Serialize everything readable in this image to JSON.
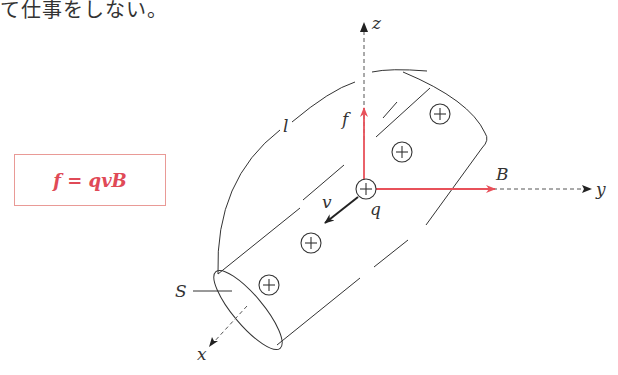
{
  "caption": "て仕事をしない。",
  "formula": "f = qvB",
  "labels": {
    "z": "z",
    "y": "y",
    "x": "x",
    "B": "B",
    "f": "f",
    "v": "v",
    "q": "q",
    "l": "l",
    "S": "S"
  },
  "colors": {
    "force_vector": "#e8515a",
    "field_vector": "#e8515a",
    "velocity_vector": "#222222",
    "formula_text": "#e04a57",
    "formula_border": "#e99a96",
    "lines": "#333333"
  }
}
